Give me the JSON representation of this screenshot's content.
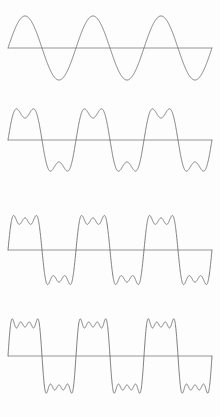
{
  "figure": {
    "background_color": "#fdfdfd",
    "curve_color": "#6e6e70",
    "axis_color": "#8b8b8d",
    "width": 220,
    "height": 417,
    "panel_count": 4
  },
  "chart_data": {
    "type": "line",
    "subtitle": "Successive partial sums of the odd-harmonic sine series",
    "xlabel": "",
    "ylabel": "",
    "grid": false,
    "legend": "none",
    "x": {
      "label": "time",
      "range": [
        0,
        3
      ],
      "unit": "cycles",
      "cycles_shown": 3,
      "tick_labels": []
    },
    "y": {
      "label": "amplitude",
      "range": [
        -1.35,
        1.35
      ],
      "tick_labels": [],
      "zero_line": true
    },
    "series": [
      {
        "name": "1 term (fundamental)",
        "panel": 1,
        "harmonics": [
          1
        ],
        "coefficients": [
          1
        ],
        "formula": "sin(x)",
        "peaks_per_half_cycle": 1,
        "peak_amplitude": 1.0,
        "baseline_y_px": 48,
        "peak_y_px": 16,
        "trough_y_px": 80,
        "amplitude_px": 32
      },
      {
        "name": "2 terms (fundamental + 3rd harmonic)",
        "panel": 2,
        "harmonics": [
          1,
          3
        ],
        "coefficients": [
          1,
          0.3333
        ],
        "formula": "sin(x) + sin(3x)/3",
        "peaks_per_half_cycle": 2,
        "peak_amplitude": 1.15,
        "baseline_y_px": 140,
        "peak_y_px": 107,
        "trough_y_px": 175,
        "amplitude_px": 33
      },
      {
        "name": "3 terms (through 5th harmonic)",
        "panel": 3,
        "harmonics": [
          1,
          3,
          5
        ],
        "coefficients": [
          1,
          0.3333,
          0.2
        ],
        "formula": "sin(x) + sin(3x)/3 + sin(5x)/5",
        "peaks_per_half_cycle": 3,
        "peak_amplitude": 1.2,
        "baseline_y_px": 250,
        "peak_y_px": 213,
        "trough_y_px": 288,
        "amplitude_px": 37
      },
      {
        "name": "4 terms (through 7th harmonic)",
        "panel": 4,
        "harmonics": [
          1,
          3,
          5,
          7
        ],
        "coefficients": [
          1,
          0.3333,
          0.2,
          0.1429
        ],
        "formula": "sin(x) + sin(3x)/3 + sin(5x)/5 + sin(7x)/7",
        "peaks_per_half_cycle": 4,
        "peak_amplitude": 1.25,
        "baseline_y_px": 356,
        "peak_y_px": 317,
        "trough_y_px": 400,
        "amplitude_px": 40
      }
    ],
    "panel_geometry": [
      {
        "index": 1,
        "top": 0,
        "height": 96,
        "baseline": 48,
        "amplitude": 32,
        "x_start": 8,
        "x_end": 212
      },
      {
        "index": 2,
        "top": 96,
        "height": 100,
        "baseline": 44,
        "amplitude": 33,
        "x_start": 8,
        "x_end": 212
      },
      {
        "index": 3,
        "top": 200,
        "height": 100,
        "baseline": 50,
        "amplitude": 37,
        "x_start": 8,
        "x_end": 212
      },
      {
        "index": 4,
        "top": 305,
        "height": 112,
        "baseline": 51,
        "amplitude": 40,
        "x_start": 8,
        "x_end": 212
      }
    ]
  }
}
